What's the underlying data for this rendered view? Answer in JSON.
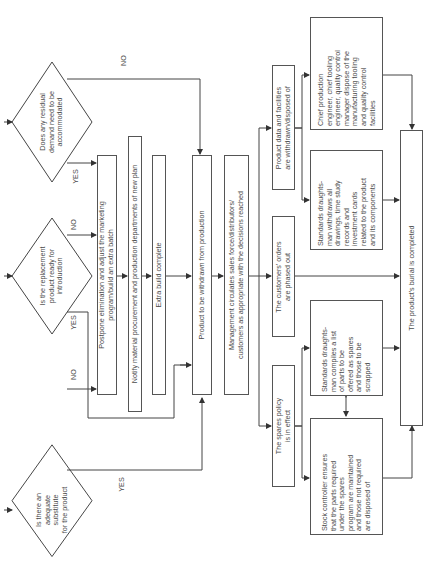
{
  "diagram": {
    "orientation": "rotated-90-ccw",
    "decisions": [
      {
        "id": "d1",
        "text": "Is there an\nadequate substitute\nfor the  product",
        "yes": "YES",
        "no": "NO"
      },
      {
        "id": "d2",
        "text": "Is the replacement\nproduct ready for\nintroduction",
        "yes": "YES",
        "no": "NO"
      },
      {
        "id": "d3",
        "text": "Does any residual\ndemand need to be\naccommodated",
        "yes": "YES",
        "no": "NO"
      }
    ],
    "steps": {
      "postpone": "Postpone elimination and adjust the marketing\nprogram/build an extra batch",
      "notify": "Notify material procurement and production departments of new plan",
      "extra_build": "Extra build complete",
      "withdrawn": "Product to be withdrawn from production",
      "management": "Management circulates sales force/distributors/\ncustomers as appropriate with the decisions reached",
      "orders": "The customers' orders\nare phased out",
      "product_data": "Product data and facilities\nare withdrawn/disposed of",
      "spares": "The spares policy\nis in effect",
      "draughtsman_withdraws": "Standards draughts-\nman withdraws all\ndrawings, time study\nrecords and\ninvestment cards\nrelated to the product\nand its components",
      "chief_engineer": "Chief production\nengineer, chief tooling\nengineer, quality control\nmanager dispose of the\nmanufacturing tooling\nand quality control\nfacilities",
      "draughtsman_compiles": "Standards draughts-\nman compiles a list\nof parts to be\noffered as spares\nand those to be\nscrapped",
      "stock_controller": "Stock controller ensures\nthat the parts required\nunder the spares\nprogram are maintained\nand those not required\nare disposed of",
      "burial": "The product's burial is completed"
    }
  }
}
